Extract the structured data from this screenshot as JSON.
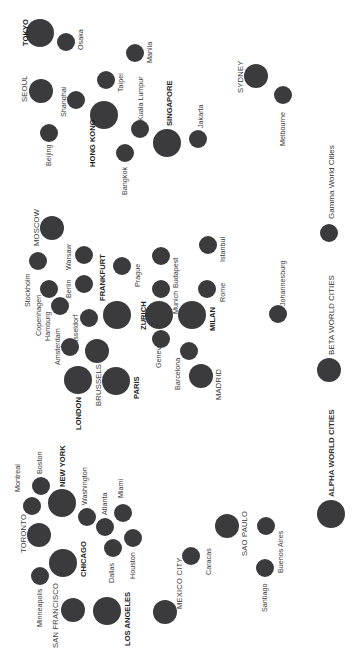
{
  "diagram": {
    "circle_color": "#3b3b3d",
    "orientation": "rotated -90deg (text reads bottom-to-top)",
    "tiers": {
      "alpha": {
        "label": "ALPHA WORLD CITIES",
        "radius": 14
      },
      "beta": {
        "label": "BETA WORLD CITIES",
        "radius": 12
      },
      "gamma": {
        "label": "Gamma World Cities",
        "radius": 9
      }
    },
    "regions": [
      {
        "name": "Asia-Pacific",
        "cities": [
          {
            "name": "TOKYO",
            "tier": "alpha",
            "x": 40,
            "y": 33,
            "lx": 22,
            "ly": 46
          },
          {
            "name": "Osaka",
            "tier": "gamma",
            "x": 66,
            "y": 42,
            "lx": 77,
            "ly": 50
          },
          {
            "name": "Manila",
            "tier": "gamma",
            "x": 135,
            "y": 53,
            "lx": 146,
            "ly": 63
          },
          {
            "name": "SEOUL",
            "tier": "beta",
            "x": 41,
            "y": 91,
            "lx": 21,
            "ly": 102
          },
          {
            "name": "Shanghai",
            "tier": "gamma",
            "x": 76,
            "y": 100,
            "lx": 60,
            "ly": 117
          },
          {
            "name": "Taipei",
            "tier": "gamma",
            "x": 106,
            "y": 80,
            "lx": 117,
            "ly": 92
          },
          {
            "name": "HONG KONG",
            "tier": "alpha",
            "x": 104,
            "y": 115,
            "lx": 89,
            "ly": 167
          },
          {
            "name": "Kuala Lumpur",
            "tier": "gamma",
            "x": 140,
            "y": 129,
            "lx": 137,
            "ly": 121
          },
          {
            "name": "Bangkok",
            "tier": "gamma",
            "x": 125,
            "y": 153,
            "lx": 121,
            "ly": 195
          },
          {
            "name": "Beijing",
            "tier": "gamma",
            "x": 49,
            "y": 133,
            "lx": 45,
            "ly": 166
          },
          {
            "name": "SINGAPORE",
            "tier": "alpha",
            "x": 167,
            "y": 143,
            "lx": 166,
            "ly": 126
          },
          {
            "name": "Jakarta",
            "tier": "gamma",
            "x": 198,
            "y": 139,
            "lx": 197,
            "ly": 128
          },
          {
            "name": "SYDNEY",
            "tier": "beta",
            "x": 256,
            "y": 76,
            "lx": 237,
            "ly": 93
          },
          {
            "name": "Melbourne",
            "tier": "gamma",
            "x": 283,
            "y": 95,
            "lx": 279,
            "ly": 146
          }
        ]
      },
      {
        "name": "Europe & Africa",
        "cities": [
          {
            "name": "MOSCOW",
            "tier": "beta",
            "x": 52,
            "y": 228,
            "lx": 33,
            "ly": 246
          },
          {
            "name": "Stockholm",
            "tier": "gamma",
            "x": 38,
            "y": 261,
            "lx": 24,
            "ly": 307
          },
          {
            "name": "Warsaw",
            "tier": "gamma",
            "x": 84,
            "y": 255,
            "lx": 65,
            "ly": 270
          },
          {
            "name": "Berlin",
            "tier": "gamma",
            "x": 84,
            "y": 284,
            "lx": 65,
            "ly": 298
          },
          {
            "name": "Copenhagen",
            "tier": "gamma",
            "x": 49,
            "y": 289,
            "lx": 35,
            "ly": 336
          },
          {
            "name": "Hamburg",
            "tier": "gamma",
            "x": 60,
            "y": 306,
            "lx": 44,
            "ly": 341
          },
          {
            "name": "Dusseldorf",
            "tier": "gamma",
            "x": 89,
            "y": 318,
            "lx": 72,
            "ly": 349
          },
          {
            "name": "FRANKFURT",
            "tier": "alpha",
            "x": 117,
            "y": 315,
            "lx": 99,
            "ly": 301
          },
          {
            "name": "Prague",
            "tier": "gamma",
            "x": 122,
            "y": 266,
            "lx": 134,
            "ly": 287
          },
          {
            "name": "Amsterdam",
            "tier": "gamma",
            "x": 70,
            "y": 347,
            "lx": 54,
            "ly": 365
          },
          {
            "name": "BRUSSELS",
            "tier": "beta",
            "x": 97,
            "y": 351,
            "lx": 95,
            "ly": 406
          },
          {
            "name": "LONDON",
            "tier": "alpha",
            "x": 78,
            "y": 380,
            "lx": 75,
            "ly": 430
          },
          {
            "name": "PARIS",
            "tier": "alpha",
            "x": 116,
            "y": 381,
            "lx": 133,
            "ly": 399
          },
          {
            "name": "Budapest",
            "tier": "gamma",
            "x": 161,
            "y": 256,
            "lx": 172,
            "ly": 288
          },
          {
            "name": "Munich",
            "tier": "gamma",
            "x": 161,
            "y": 289,
            "lx": 172,
            "ly": 314
          },
          {
            "name": "ZURICH",
            "tier": "alpha",
            "x": 159,
            "y": 315,
            "lx": 140,
            "ly": 330
          },
          {
            "name": "Geneva",
            "tier": "gamma",
            "x": 161,
            "y": 339,
            "lx": 155,
            "ly": 368
          },
          {
            "name": "MILAN",
            "tier": "alpha",
            "x": 192,
            "y": 315,
            "lx": 209,
            "ly": 331
          },
          {
            "name": "Istanbul",
            "tier": "gamma",
            "x": 208,
            "y": 245,
            "lx": 219,
            "ly": 262
          },
          {
            "name": "Rome",
            "tier": "gamma",
            "x": 207,
            "y": 289,
            "lx": 219,
            "ly": 302
          },
          {
            "name": "Barcelona",
            "tier": "gamma",
            "x": 189,
            "y": 351,
            "lx": 174,
            "ly": 390
          },
          {
            "name": "MADRID",
            "tier": "beta",
            "x": 201,
            "y": 376,
            "lx": 215,
            "ly": 400
          },
          {
            "name": "Johannesburg",
            "tier": "gamma",
            "x": 278,
            "y": 314,
            "lx": 279,
            "ly": 306
          }
        ]
      },
      {
        "name": "Americas",
        "cities": [
          {
            "name": "Montreal",
            "tier": "gamma",
            "x": 32,
            "y": 506,
            "lx": 14,
            "ly": 492
          },
          {
            "name": "Boston",
            "tier": "gamma",
            "x": 41,
            "y": 486,
            "lx": 36,
            "ly": 474
          },
          {
            "name": "NEW YORK",
            "tier": "alpha",
            "x": 62,
            "y": 503,
            "lx": 59,
            "ly": 487
          },
          {
            "name": "TORONTO",
            "tier": "beta",
            "x": 39,
            "y": 535,
            "lx": 20,
            "ly": 553
          },
          {
            "name": "Washington",
            "tier": "gamma",
            "x": 87,
            "y": 517,
            "lx": 81,
            "ly": 505
          },
          {
            "name": "Atlanta",
            "tier": "gamma",
            "x": 105,
            "y": 527,
            "lx": 101,
            "ly": 515
          },
          {
            "name": "Miami",
            "tier": "gamma",
            "x": 123,
            "y": 513,
            "lx": 117,
            "ly": 498
          },
          {
            "name": "CHICAGO",
            "tier": "alpha",
            "x": 63,
            "y": 563,
            "lx": 80,
            "ly": 577
          },
          {
            "name": "Minneapolis",
            "tier": "gamma",
            "x": 40,
            "y": 576,
            "lx": 36,
            "ly": 627
          },
          {
            "name": "Dallas",
            "tier": "gamma",
            "x": 113,
            "y": 548,
            "lx": 108,
            "ly": 583
          },
          {
            "name": "Houston",
            "tier": "gamma",
            "x": 133,
            "y": 538,
            "lx": 129,
            "ly": 579
          },
          {
            "name": "SAN FRANCISCO",
            "tier": "beta",
            "x": 73,
            "y": 610,
            "lx": 52,
            "ly": 648
          },
          {
            "name": "LOS ANGELES",
            "tier": "alpha",
            "x": 107,
            "y": 611,
            "lx": 124,
            "ly": 646
          },
          {
            "name": "MEXICO CITY",
            "tier": "beta",
            "x": 165,
            "y": 612,
            "lx": 176,
            "ly": 609
          },
          {
            "name": "Caracas",
            "tier": "gamma",
            "x": 191,
            "y": 556,
            "lx": 205,
            "ly": 575
          },
          {
            "name": "SAO PAULO",
            "tier": "beta",
            "x": 227,
            "y": 526,
            "lx": 241,
            "ly": 556
          },
          {
            "name": "Buenos Aires",
            "tier": "gamma",
            "x": 266,
            "y": 526,
            "lx": 277,
            "ly": 573
          },
          {
            "name": "Santiago",
            "tier": "gamma",
            "x": 265,
            "y": 568,
            "lx": 261,
            "ly": 612
          }
        ]
      }
    ]
  },
  "legend": {
    "items": [
      {
        "label": "Gamma World Cities",
        "tier": "gamma",
        "x": 329,
        "y": 233,
        "lx": 327,
        "ly": 219
      },
      {
        "label": "BETA WORLD CITIES",
        "tier": "beta",
        "x": 329,
        "y": 370,
        "lx": 327,
        "ly": 355
      },
      {
        "label": "ALPHA WORLD CITIES",
        "tier": "alpha",
        "x": 331,
        "y": 514,
        "lx": 327,
        "ly": 497
      }
    ]
  }
}
